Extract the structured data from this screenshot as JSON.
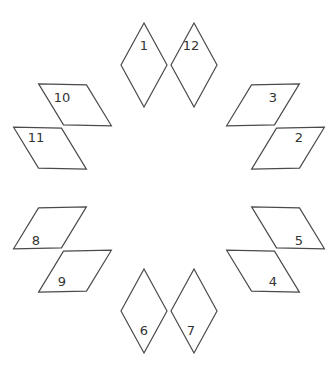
{
  "diagram": {
    "center": [
      169,
      188
    ],
    "stroke_color": "#4a4a4a",
    "label_color": "#333333",
    "base_rhombus": [
      [
        144,
        23
      ],
      [
        121,
        65
      ],
      [
        144,
        107
      ],
      [
        167,
        65
      ]
    ],
    "rhombi": [
      {
        "label": "1",
        "label_pos": [
          144,
          45
        ]
      },
      {
        "label": "2",
        "label_pos": [
          299,
          137
        ]
      },
      {
        "label": "3",
        "label_pos": [
          273,
          97
        ]
      },
      {
        "label": "4",
        "label_pos": [
          273,
          281
        ]
      },
      {
        "label": "5",
        "label_pos": [
          299,
          240
        ]
      },
      {
        "label": "6",
        "label_pos": [
          144,
          330
        ]
      },
      {
        "label": "7",
        "label_pos": [
          191,
          330
        ]
      },
      {
        "label": "8",
        "label_pos": [
          36,
          240
        ]
      },
      {
        "label": "9",
        "label_pos": [
          62,
          281
        ]
      },
      {
        "label": "10",
        "label_pos": [
          62,
          97
        ]
      },
      {
        "label": "11",
        "label_pos": [
          36,
          137
        ]
      },
      {
        "label": "12",
        "label_pos": [
          191,
          45
        ]
      }
    ]
  }
}
